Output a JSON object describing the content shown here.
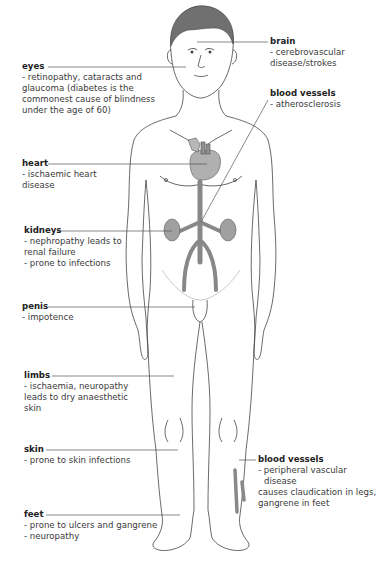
{
  "diagram": {
    "type": "anatomical-annotated"
  },
  "labels": {
    "brain": {
      "title": "brain",
      "lines": [
        "- cerebrovascular",
        "  disease/strokes"
      ]
    },
    "eyes": {
      "title": "eyes",
      "lines": [
        "- retinopathy, cataracts and",
        "  glaucoma (diabetes is the",
        "  commonest cause of blindness",
        "  under the age of 60)"
      ]
    },
    "blood_vessels_upper": {
      "title": "blood vessels",
      "lines": [
        "- atherosclerosis"
      ]
    },
    "heart": {
      "title": "heart",
      "lines": [
        "- ischaemic heart",
        "  disease"
      ]
    },
    "kidneys": {
      "title": "kidneys",
      "lines": [
        "- nephropathy leads to",
        "  renal failure",
        "- prone to infections"
      ]
    },
    "penis": {
      "title": "penis",
      "lines": [
        "- impotence"
      ]
    },
    "limbs": {
      "title": "limbs",
      "lines": [
        "- ischaemia, neuropathy",
        "  leads to dry anaesthetic",
        "  skin"
      ]
    },
    "skin": {
      "title": "skin",
      "lines": [
        "- prone to skin infections"
      ]
    },
    "blood_vessels_lower": {
      "title": "blood vessels",
      "lines": [
        "- peripheral vascular disease",
        "  causes claudication in legs,",
        "  gangrene in feet"
      ]
    },
    "feet": {
      "title": "feet",
      "lines": [
        "- prone to ulcers and gangrene",
        "- neuropathy"
      ]
    }
  },
  "colors": {
    "outline": "#444444",
    "organ_fill": "#a8a8a8",
    "organ_dark": "#8a8a8a",
    "hair": "#707070",
    "leader_line": "#555555",
    "text": "#333333"
  }
}
